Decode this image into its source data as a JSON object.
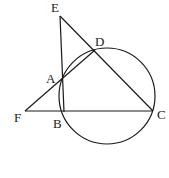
{
  "diagram": {
    "type": "geometry",
    "stroke_color": "#1a1a1a",
    "background": "#ffffff",
    "points": {
      "E": {
        "label": "E",
        "x": 60,
        "y": 16,
        "lx": 51,
        "ly": 12
      },
      "D": {
        "label": "D",
        "x": 95,
        "y": 50,
        "lx": 95,
        "ly": 46
      },
      "A": {
        "label": "A",
        "x": 63,
        "y": 80,
        "lx": 46,
        "ly": 83
      },
      "F": {
        "label": "F",
        "x": 25,
        "y": 111,
        "lx": 14,
        "ly": 122
      },
      "B": {
        "label": "B",
        "x": 64,
        "y": 112,
        "lx": 53,
        "ly": 128
      },
      "C": {
        "label": "C",
        "x": 153,
        "y": 111,
        "lx": 157,
        "ly": 119
      }
    },
    "circle": {
      "cx": 107,
      "cy": 96,
      "r": 48
    },
    "segments": [
      [
        "E",
        "B"
      ],
      [
        "E",
        "C"
      ],
      [
        "F",
        "D"
      ],
      [
        "F",
        "C"
      ]
    ]
  }
}
